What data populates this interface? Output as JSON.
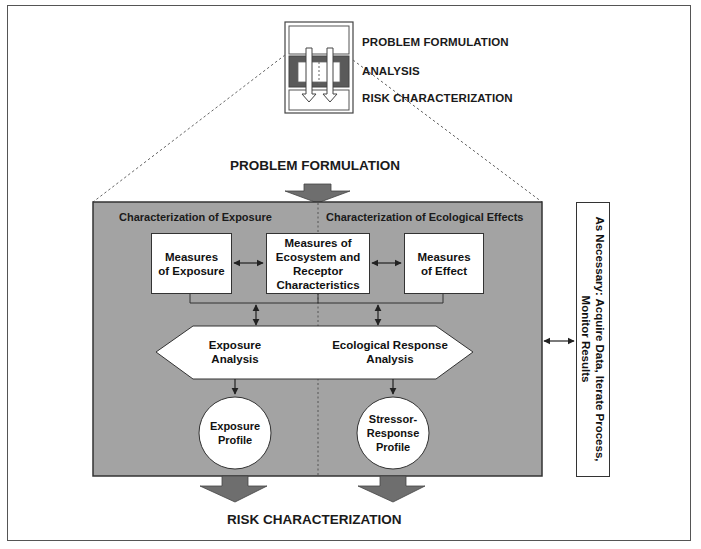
{
  "legend": {
    "items": [
      {
        "label": "PROBLEM FORMULATION"
      },
      {
        "label": "ANALYSIS"
      },
      {
        "label": "RISK CHARACTERIZATION"
      }
    ]
  },
  "top_label": "PROBLEM FORMULATION",
  "bottom_label": "RISK CHARACTERIZATION",
  "analysis_panel": {
    "left_section": "Characterization of Exposure",
    "right_section": "Characterization of Ecological Effects",
    "measures": {
      "exposure": "Measures of Exposure",
      "ecosystem": "Measures of Ecosystem and Receptor Characteristics",
      "effect": "Measures of Effect"
    },
    "analysis": {
      "exposure": "Exposure Analysis",
      "ecological": "Ecological Response Analysis"
    },
    "profiles": {
      "exposure": "Exposure Profile",
      "stressor": "Stressor-Response Profile"
    }
  },
  "side_box": {
    "text": "As Necessary: Acquire Data, Iterate Process, Monitor Results"
  },
  "colors": {
    "panel_gray": "#a3a3a3",
    "arrow_gray": "#6e6e6e",
    "legend_dark": "#5a5a5a",
    "border": "#333333"
  }
}
